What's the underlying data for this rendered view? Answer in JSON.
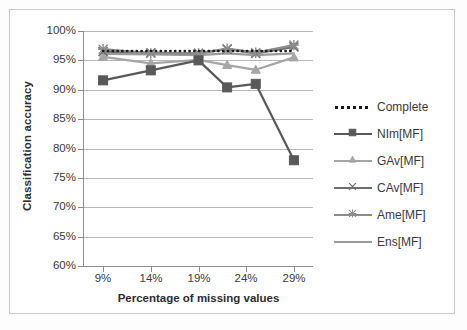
{
  "chart_data": {
    "type": "line",
    "title": "",
    "xlabel": "Percentage of missing values",
    "ylabel": "Classification accuracy",
    "x": [
      9,
      14,
      19,
      22,
      25,
      29
    ],
    "xlim": [
      7,
      31
    ],
    "ylim": [
      60,
      100
    ],
    "x_tick_labels": [
      "9%",
      "14%",
      "19%",
      "24%",
      "29%"
    ],
    "x_tick_values": [
      9,
      14,
      19,
      24,
      29
    ],
    "y_tick_labels": [
      "60%",
      "65%",
      "70%",
      "75%",
      "80%",
      "85%",
      "90%",
      "95%",
      "100%"
    ],
    "y_tick_values": [
      60,
      65,
      70,
      75,
      80,
      85,
      90,
      95,
      100
    ],
    "grid": "horizontal",
    "legend_position": "right",
    "series": [
      {
        "name": "Complete",
        "style": "dotted",
        "marker": "none",
        "color": "#1a1a1a",
        "values": [
          96.6,
          96.6,
          96.6,
          96.6,
          96.6,
          96.6
        ]
      },
      {
        "name": "NIm[MF]",
        "style": "solid",
        "marker": "square",
        "color": "#595959",
        "values": [
          91.6,
          93.3,
          95.0,
          90.4,
          91.0,
          78.0
        ]
      },
      {
        "name": "GAv[MF]",
        "style": "solid",
        "marker": "triangle",
        "color": "#a6a6a6",
        "values": [
          95.6,
          94.5,
          95.1,
          94.2,
          93.4,
          95.5
        ]
      },
      {
        "name": "CAv[MF]",
        "style": "solid",
        "marker": "x",
        "color": "#6e6e6e",
        "values": [
          96.5,
          96.3,
          96.2,
          96.9,
          96.2,
          97.3
        ]
      },
      {
        "name": "Ame[MF]",
        "style": "solid",
        "marker": "asterisk",
        "color": "#8c8c8c",
        "values": [
          96.9,
          96.2,
          96.2,
          97.0,
          96.3,
          97.6
        ]
      },
      {
        "name": "Ens[MF]",
        "style": "solid",
        "marker": "none",
        "color": "#9a9a9a",
        "values": [
          96.1,
          96.0,
          95.9,
          96.2,
          95.9,
          96.2
        ]
      }
    ]
  },
  "legend": {
    "items": [
      {
        "label": "Complete"
      },
      {
        "label": "NIm[MF]"
      },
      {
        "label": "GAv[MF]"
      },
      {
        "label": "CAv[MF]"
      },
      {
        "label": "Ame[MF]"
      },
      {
        "label": "Ens[MF]"
      }
    ]
  }
}
